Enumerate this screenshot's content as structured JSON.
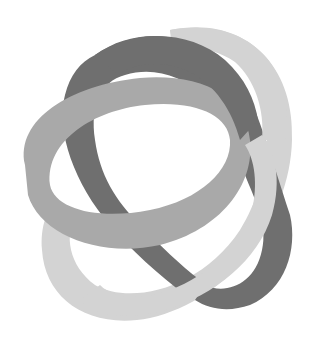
{
  "image": {
    "description": "Grayscale logo of three interlocking elliptical ribbon bands",
    "width": 317,
    "height": 343,
    "background": "#ffffff"
  },
  "bands": [
    {
      "name": "dark-band",
      "color": "#6f6f6f"
    },
    {
      "name": "medium-band",
      "color": "#a9a9a9"
    },
    {
      "name": "light-band",
      "color": "#d3d3d3"
    }
  ]
}
